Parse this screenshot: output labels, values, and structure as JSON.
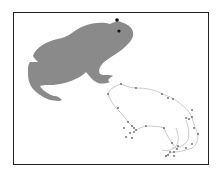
{
  "figure": {
    "frame_color": "#222222",
    "silhouette": {
      "label": "frog-silhouette",
      "fill": "#8a8a8a",
      "eye_color": "#111111"
    },
    "outline": {
      "label": "frog-dot-outline",
      "stroke": "#bdbdbd",
      "dot_color": "#666666"
    }
  }
}
